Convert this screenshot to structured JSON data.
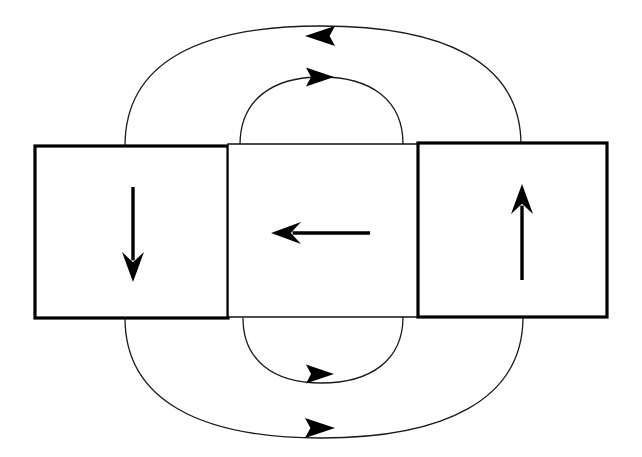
{
  "figure": {
    "background_color": "#ffffff",
    "ink_color": "#000000",
    "width": 642,
    "height": 457
  },
  "canvas": {
    "view_box": "0 0 642 457"
  },
  "style": {
    "box_stroke_color": "#000000",
    "box_fill_color": "#ffffff",
    "box_outer_stroke_width": 3.2,
    "box_inner_stroke_width": 1.4,
    "domain_arrow_color": "#000000",
    "domain_arrow_stroke_width": 3.4,
    "field_line_color": "#1a1a1a",
    "field_line_stroke_width": 1.3
  },
  "boxes": [
    {
      "name": "left-domain",
      "x": 35,
      "y": 146,
      "width": 193,
      "height": 172,
      "stroke_width": 3.2,
      "label": "Left domain, magnetization down"
    },
    {
      "name": "middle-domain",
      "x": 228,
      "y": 144,
      "width": 190,
      "height": 173,
      "stroke_width": 1.4,
      "label": "Middle closure domain, magnetization left"
    },
    {
      "name": "right-domain",
      "x": 418,
      "y": 143,
      "width": 189,
      "height": 174,
      "stroke_width": 3.2,
      "label": "Right domain, magnetization up"
    }
  ],
  "domain_arrows": [
    {
      "name": "down-arrow",
      "direction": "down",
      "x1": 133,
      "y1": 187,
      "x2": 133,
      "y2": 282,
      "head_width": 22,
      "head_length": 30,
      "description": "Magnetization vector pointing down in the left domain"
    },
    {
      "name": "left-arrow",
      "direction": "left",
      "x1": 370,
      "y1": 233,
      "x2": 271,
      "y2": 233,
      "head_width": 22,
      "head_length": 30,
      "description": "Magnetization vector pointing left in the middle domain"
    },
    {
      "name": "up-arrow",
      "direction": "up",
      "x1": 522,
      "y1": 280,
      "x2": 522,
      "y2": 184,
      "head_width": 22,
      "head_length": 30,
      "description": "Magnetization vector pointing up in the right domain"
    }
  ],
  "field_lines": [
    {
      "name": "outer-top-field-line",
      "position": "top",
      "layer": "outer",
      "path": "M 125 146 C 125 62 200 26 321 26 C 444 26 521 62 521 145",
      "arrow": {
        "name": "outer-top-arrowhead",
        "direction": "left",
        "x": 320,
        "y": 36,
        "width": 30,
        "height": 20
      }
    },
    {
      "name": "inner-top-field-line",
      "position": "top",
      "layer": "inner",
      "path": "M 240 145 C 240 100 272 77 321 77 C 371 77 403 100 403 144",
      "arrow": {
        "name": "inner-top-arrowhead",
        "direction": "right",
        "x": 320,
        "y": 77,
        "width": 28,
        "height": 19
      }
    },
    {
      "name": "inner-bottom-field-line",
      "position": "bottom",
      "layer": "inner",
      "path": "M 243 318 C 243 360 273 383 321 383 C 371 383 403 360 403 317",
      "arrow": {
        "name": "inner-bottom-arrowhead",
        "direction": "right",
        "x": 320,
        "y": 374,
        "width": 28,
        "height": 19
      }
    },
    {
      "name": "outer-bottom-field-line",
      "position": "bottom",
      "layer": "outer",
      "path": "M 125 318 C 125 400 200 438 321 438 C 444 438 523 400 523 317",
      "arrow": {
        "name": "outer-bottom-arrowhead",
        "direction": "right",
        "x": 320,
        "y": 428,
        "width": 30,
        "height": 20
      }
    }
  ]
}
